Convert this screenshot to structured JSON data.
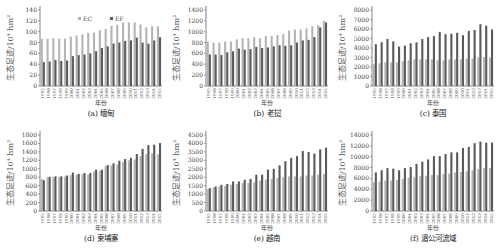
{
  "colors": {
    "EC": "#b4b4b4",
    "EF": "#5a5a5a",
    "axis": "#666666"
  },
  "common": {
    "ylabel": "生态足迹/10⁴ hm²",
    "xlabel": "年份",
    "legend": [
      "EC",
      "EF"
    ],
    "years": [
      "1995",
      "1996",
      "1997",
      "1998",
      "1999",
      "2000",
      "2001",
      "2002",
      "2003",
      "2004",
      "2005",
      "2006",
      "2007",
      "2008",
      "2009",
      "2010",
      "2011",
      "2012",
      "2013",
      "2014",
      "2015"
    ]
  },
  "chart_data": [
    {
      "id": "a",
      "type": "bar",
      "title": "(a) 缅甸",
      "xlabel": "年份",
      "ylabel": "生态足迹/10⁴ hm²",
      "ylim": [
        0,
        140
      ],
      "ystep": 20,
      "categories": [
        "1995",
        "1996",
        "1997",
        "1998",
        "1999",
        "2000",
        "2001",
        "2002",
        "2003",
        "2004",
        "2005",
        "2006",
        "2007",
        "2008",
        "2009",
        "2010",
        "2011",
        "2012",
        "2013",
        "2014",
        "2015"
      ],
      "legend_position": "top",
      "series": [
        {
          "name": "EC",
          "values": [
            87,
            87,
            88,
            87,
            87,
            91,
            93,
            95,
            98,
            98,
            103,
            105,
            111,
            113,
            117,
            117,
            117,
            113,
            108,
            110,
            110
          ]
        },
        {
          "name": "EF",
          "values": [
            44,
            45,
            48,
            46,
            47,
            55,
            57,
            58,
            60,
            64,
            70,
            73,
            78,
            80,
            83,
            84,
            89,
            80,
            78,
            84,
            90
          ]
        }
      ]
    },
    {
      "id": "b",
      "type": "bar",
      "title": "(b) 老挝",
      "xlabel": "年份",
      "ylabel": "生态足迹/10⁴ hm²",
      "ylim": [
        0,
        1400
      ],
      "ystep": 200,
      "categories": [
        "1995",
        "1996",
        "1997",
        "1998",
        "1999",
        "2000",
        "2001",
        "2002",
        "2003",
        "2004",
        "2005",
        "2006",
        "2007",
        "2008",
        "2009",
        "2010",
        "2011",
        "2012",
        "2013",
        "2014",
        "2015"
      ],
      "series": [
        {
          "name": "EC",
          "values": [
            820,
            800,
            800,
            820,
            820,
            860,
            880,
            880,
            900,
            880,
            920,
            920,
            940,
            960,
            1020,
            1040,
            1040,
            1060,
            1100,
            1120,
            1200
          ]
        },
        {
          "name": "EF",
          "values": [
            580,
            580,
            570,
            620,
            640,
            690,
            670,
            680,
            720,
            700,
            710,
            730,
            750,
            740,
            750,
            800,
            840,
            850,
            900,
            1080,
            1170
          ]
        }
      ]
    },
    {
      "id": "c",
      "type": "bar",
      "title": "(c) 泰国",
      "xlabel": "年份",
      "ylabel": "生态足迹/10⁴ hm²",
      "ylim": [
        0,
        8000
      ],
      "ystep": 1000,
      "categories": [
        "1995",
        "1996",
        "1997",
        "1998",
        "1999",
        "2000",
        "2001",
        "2002",
        "2003",
        "2004",
        "2005",
        "2006",
        "2007",
        "2008",
        "2009",
        "2010",
        "2011",
        "2012",
        "2013",
        "2014",
        "2015"
      ],
      "series": [
        {
          "name": "EC",
          "values": [
            2300,
            2400,
            2500,
            2500,
            2500,
            2600,
            2700,
            2800,
            2800,
            2800,
            2800,
            2700,
            2700,
            2800,
            2800,
            2800,
            2900,
            2900,
            3000,
            3050,
            3000
          ]
        },
        {
          "name": "EF",
          "values": [
            4400,
            4600,
            4950,
            4700,
            4150,
            4250,
            4500,
            4600,
            4950,
            5150,
            5250,
            5700,
            5450,
            5500,
            5600,
            5350,
            5800,
            5900,
            6500,
            6350,
            5950
          ]
        }
      ]
    },
    {
      "id": "d",
      "type": "bar",
      "title": "(d) 柬埔寨",
      "xlabel": "年份",
      "ylabel": "生态足迹/10⁴ hm²",
      "ylim": [
        0,
        1800
      ],
      "ystep": 200,
      "categories": [
        "1995",
        "1996",
        "1997",
        "1998",
        "1999",
        "2000",
        "2001",
        "2002",
        "2003",
        "2004",
        "2005",
        "2006",
        "2007",
        "2008",
        "2009",
        "2010",
        "2011",
        "2012",
        "2013",
        "2014",
        "2015"
      ],
      "series": [
        {
          "name": "EC",
          "values": [
            760,
            800,
            800,
            800,
            820,
            850,
            860,
            870,
            860,
            940,
            950,
            1060,
            1080,
            1100,
            1160,
            1200,
            1220,
            1300,
            1340,
            1360,
            1340
          ]
        },
        {
          "name": "EF",
          "values": [
            730,
            810,
            820,
            820,
            840,
            910,
            880,
            900,
            900,
            980,
            980,
            1090,
            1130,
            1190,
            1230,
            1260,
            1350,
            1470,
            1560,
            1570,
            1610
          ]
        }
      ]
    },
    {
      "id": "e",
      "type": "bar",
      "title": "(e) 越南",
      "xlabel": "年份",
      "ylabel": "生态足迹/10⁴ hm²",
      "ylim": [
        0,
        4500
      ],
      "ystep": 500,
      "categories": [
        "1995",
        "1996",
        "1997",
        "1998",
        "1999",
        "2000",
        "2001",
        "2002",
        "2003",
        "2004",
        "2005",
        "2006",
        "2007",
        "2008",
        "2009",
        "2010",
        "2011",
        "2012",
        "2013",
        "2014",
        "2015"
      ],
      "series": [
        {
          "name": "EC",
          "values": [
            1300,
            1400,
            1450,
            1500,
            1550,
            1600,
            1650,
            1650,
            1700,
            1800,
            1850,
            1900,
            1950,
            2000,
            2050,
            2050,
            2050,
            2100,
            2100,
            2150,
            2200
          ]
        },
        {
          "name": "EF",
          "values": [
            1350,
            1450,
            1550,
            1600,
            1750,
            1750,
            1850,
            1900,
            2150,
            2150,
            2450,
            2500,
            2700,
            2950,
            3150,
            3250,
            3550,
            3500,
            3400,
            3650,
            3750
          ]
        }
      ]
    },
    {
      "id": "f",
      "type": "bar",
      "title": "(f) 湄公河流域",
      "xlabel": "年份",
      "ylabel": "生态足迹/10⁴ hm²",
      "ylim": [
        0,
        14000
      ],
      "ystep": 2000,
      "categories": [
        "1995",
        "1996",
        "1997",
        "1998",
        "1999",
        "2000",
        "2001",
        "2002",
        "2003",
        "2004",
        "2005",
        "2006",
        "2007",
        "2008",
        "2009",
        "2010",
        "2011",
        "2012",
        "2013",
        "2014",
        "2015"
      ],
      "series": [
        {
          "name": "EC",
          "values": [
            5300,
            5400,
            5600,
            5600,
            5700,
            5900,
            6100,
            6200,
            6400,
            6500,
            6600,
            6600,
            6800,
            6900,
            7100,
            7200,
            7300,
            7500,
            7700,
            7900,
            7900
          ]
        },
        {
          "name": "EF",
          "values": [
            7100,
            7500,
            7900,
            7800,
            7500,
            7900,
            8100,
            8700,
            9100,
            9500,
            10100,
            10100,
            10500,
            10800,
            10800,
            11600,
            11800,
            12500,
            12800,
            12600,
            12600
          ]
        }
      ]
    }
  ]
}
